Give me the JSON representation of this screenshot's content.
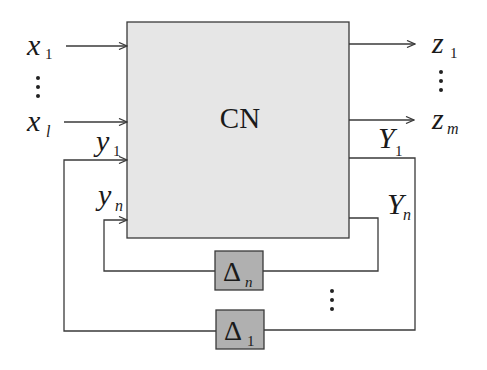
{
  "diagram": {
    "block": {
      "label": "CN",
      "fill": "#e6e6e6",
      "stroke": "#3a3a3a"
    },
    "inputs": [
      {
        "var": "x",
        "sub": "1"
      },
      {
        "var": "x",
        "sub": "l"
      }
    ],
    "outputs": [
      {
        "var": "z",
        "sub": "1"
      },
      {
        "var": "z",
        "sub": "m"
      }
    ],
    "feedback_inputs": [
      {
        "var": "y",
        "sub": "1"
      },
      {
        "var": "y",
        "sub": "n"
      }
    ],
    "feedback_outputs": [
      {
        "var": "Y",
        "sub": "1"
      },
      {
        "var": "Y",
        "sub": "n"
      }
    ],
    "delta_blocks": [
      {
        "symbol": "Δ",
        "sub": "n",
        "fill": "#b0b0b0"
      },
      {
        "symbol": "Δ",
        "sub": "1",
        "fill": "#b0b0b0"
      }
    ],
    "ellipsis": "⋮"
  }
}
